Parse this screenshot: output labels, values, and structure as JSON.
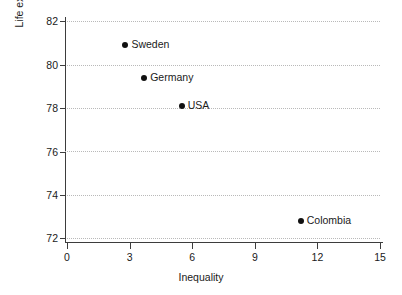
{
  "chart_data": {
    "type": "scatter",
    "title": "",
    "xlabel": "Inequality",
    "ylabel": "Life expectancy",
    "xlim": [
      0,
      15
    ],
    "ylim": [
      72,
      82
    ],
    "xticks": [
      "0",
      "3",
      "6",
      "9",
      "12",
      "15"
    ],
    "yticks": [
      "72",
      "74",
      "76",
      "78",
      "80",
      "82"
    ],
    "grid": "horizontal-dotted",
    "legend": "none",
    "point_color": "#111111",
    "grid_color": "#b9b9b9",
    "axis_color": "#3d3d3d",
    "points": [
      {
        "label": "Sweden",
        "x": 2.8,
        "y": 80.9
      },
      {
        "label": "Germany",
        "x": 3.7,
        "y": 79.4
      },
      {
        "label": "USA",
        "x": 5.5,
        "y": 78.1
      },
      {
        "label": "Colombia",
        "x": 11.2,
        "y": 72.8
      }
    ]
  }
}
